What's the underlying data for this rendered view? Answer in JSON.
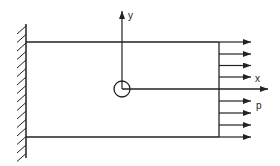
{
  "diagram": {
    "type": "cantilever-plate-with-uniform-edge-load",
    "labels": {
      "y_axis": "y",
      "x_axis": "x",
      "load": "p"
    },
    "colors": {
      "line": "#222222",
      "background": "#ffffff"
    },
    "elements": [
      "fixed-wall-support",
      "rectangular-plate",
      "origin-circle",
      "y-axis-arrow",
      "x-axis-arrow",
      "distributed-load-arrows"
    ]
  }
}
